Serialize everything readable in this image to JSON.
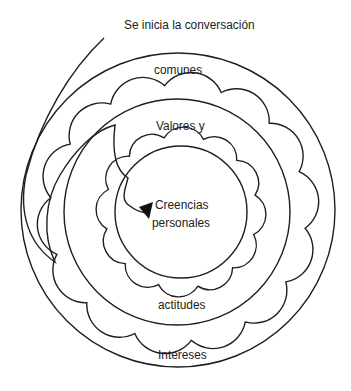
{
  "title": "Se inicia la conversación",
  "labels": {
    "start": "Se inicia la conversación",
    "outer_top": "comunes",
    "outer_bottom": "Intereses",
    "middle_top": "Valores y",
    "middle_bottom": "actitudes",
    "core_line1": "Creencias",
    "core_line2": "personales"
  },
  "layers": [
    {
      "name": "Intereses comunes",
      "shape": "circle",
      "cx": 178,
      "cy": 210,
      "r": 157
    },
    {
      "name": "outer-scallop",
      "shape": "scallop",
      "cx": 178,
      "cy": 213,
      "r": 128,
      "bumps": 14,
      "rot": 0.12
    },
    {
      "name": "Valores y actitudes",
      "shape": "circle",
      "cx": 177,
      "cy": 212,
      "r": 113
    },
    {
      "name": "inner-scallop",
      "shape": "scallop",
      "cx": 181,
      "cy": 212,
      "r": 76,
      "bumps": 12,
      "rot": 0.3
    },
    {
      "name": "Creencias personales",
      "shape": "circle",
      "cx": 181,
      "cy": 212,
      "r": 66
    }
  ],
  "colors": {
    "line": "#1e1e1e",
    "text": "#222222",
    "background": "#ffffff"
  }
}
